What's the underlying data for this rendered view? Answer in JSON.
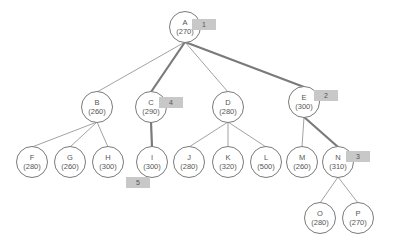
{
  "diagram": {
    "type": "tree",
    "nodes": [
      {
        "id": "A",
        "label": "A",
        "value": "(270)",
        "x": 185,
        "y": 27
      },
      {
        "id": "B",
        "label": "B",
        "value": "(260)",
        "x": 97,
        "y": 107
      },
      {
        "id": "C",
        "label": "C",
        "value": "(290)",
        "x": 151,
        "y": 107
      },
      {
        "id": "D",
        "label": "D",
        "value": "(280)",
        "x": 228,
        "y": 107
      },
      {
        "id": "E",
        "label": "E",
        "value": "(300)",
        "x": 304,
        "y": 102
      },
      {
        "id": "F",
        "label": "F",
        "value": "(280)",
        "x": 32,
        "y": 162
      },
      {
        "id": "G",
        "label": "G",
        "value": "(260)",
        "x": 70,
        "y": 162
      },
      {
        "id": "H",
        "label": "H",
        "value": "(300)",
        "x": 108,
        "y": 162
      },
      {
        "id": "I",
        "label": "I",
        "value": "(300)",
        "x": 152,
        "y": 162
      },
      {
        "id": "J",
        "label": "J",
        "value": "(280)",
        "x": 189,
        "y": 162
      },
      {
        "id": "K",
        "label": "K",
        "value": "(320)",
        "x": 228,
        "y": 162
      },
      {
        "id": "L",
        "label": "L",
        "value": "(500)",
        "x": 266,
        "y": 162
      },
      {
        "id": "M",
        "label": "M",
        "value": "(260)",
        "x": 302,
        "y": 162
      },
      {
        "id": "N",
        "label": "N",
        "value": "(310)",
        "x": 338,
        "y": 162
      },
      {
        "id": "O",
        "label": "O",
        "value": "(280)",
        "x": 320,
        "y": 218
      },
      {
        "id": "P",
        "label": "P",
        "value": "(270)",
        "x": 358,
        "y": 218
      }
    ],
    "edges": [
      {
        "from": "A",
        "to": "B",
        "highlight": false
      },
      {
        "from": "A",
        "to": "C",
        "highlight": true
      },
      {
        "from": "A",
        "to": "D",
        "highlight": false
      },
      {
        "from": "A",
        "to": "E",
        "highlight": true
      },
      {
        "from": "B",
        "to": "F",
        "highlight": false
      },
      {
        "from": "B",
        "to": "G",
        "highlight": false
      },
      {
        "from": "B",
        "to": "H",
        "highlight": false
      },
      {
        "from": "C",
        "to": "I",
        "highlight": true
      },
      {
        "from": "D",
        "to": "J",
        "highlight": false
      },
      {
        "from": "D",
        "to": "K",
        "highlight": false
      },
      {
        "from": "D",
        "to": "L",
        "highlight": false
      },
      {
        "from": "E",
        "to": "M",
        "highlight": false
      },
      {
        "from": "E",
        "to": "N",
        "highlight": true
      },
      {
        "from": "N",
        "to": "O",
        "highlight": false
      },
      {
        "from": "N",
        "to": "P",
        "highlight": false
      }
    ],
    "badges": [
      {
        "label": "1",
        "x": 204,
        "y": 25,
        "node": "A"
      },
      {
        "label": "2",
        "x": 326,
        "y": 96,
        "node": "E"
      },
      {
        "label": "3",
        "x": 358,
        "y": 157,
        "node": "N"
      },
      {
        "label": "4",
        "x": 171,
        "y": 103,
        "node": "C"
      },
      {
        "label": "5",
        "x": 138,
        "y": 183,
        "node": "I"
      }
    ],
    "colors": {
      "edge": "#8a8a8a",
      "highlight_edge": "#7a7a7a",
      "node_border": "#7a7a7a",
      "badge_bg": "#c8c8c8"
    }
  }
}
